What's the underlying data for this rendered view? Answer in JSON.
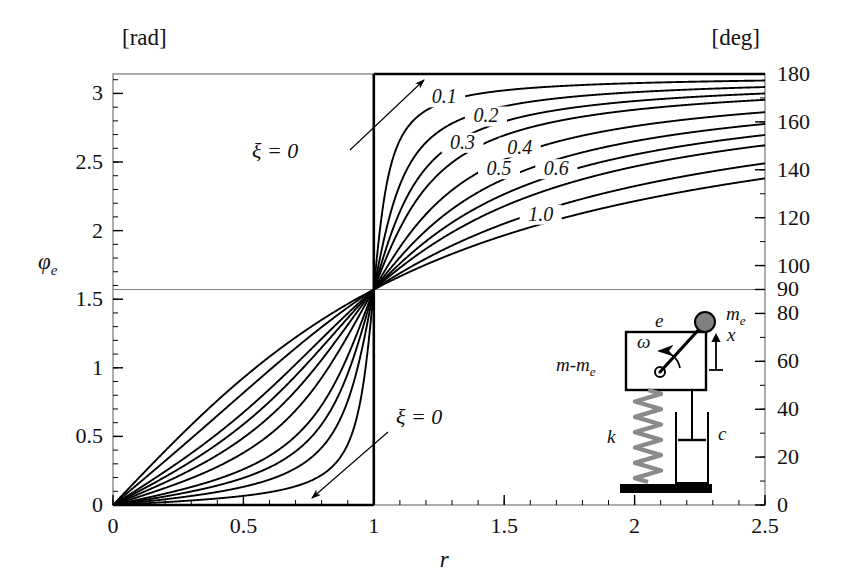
{
  "figure": {
    "left_unit": "[rad]",
    "right_unit": "[deg]",
    "x_axis_name": "r",
    "y_axis_name": "φ",
    "y_axis_name_sub": "e",
    "annotation_top": "ξ = 0",
    "annotation_bottom": "ξ = 0"
  },
  "chart_data": {
    "type": "line",
    "title": "",
    "xlabel": "r",
    "ylabel": "φ_e",
    "xlim": [
      0,
      2.5
    ],
    "ylim": [
      0,
      3.14159
    ],
    "ylim_deg": [
      0,
      180
    ],
    "grid": false,
    "legend": "inline-curve-labels",
    "x_ticks": [
      0,
      0.5,
      1,
      1.5,
      2,
      2.5
    ],
    "x_tick_labels": [
      "0",
      "0.5",
      "1",
      "1.5",
      "2",
      "2.5"
    ],
    "x_minor_step": 0.1,
    "y_ticks_rad": [
      0,
      0.5,
      1,
      1.5,
      2,
      2.5,
      3
    ],
    "y_tick_labels_rad": [
      "0",
      "0.5",
      "1",
      "1.5",
      "2",
      "2.5",
      "3"
    ],
    "y_minor_step_rad": 0.1,
    "y_ticks_deg": [
      0,
      20,
      40,
      60,
      80,
      90,
      100,
      120,
      140,
      160,
      180
    ],
    "y_tick_labels_deg": [
      "0",
      "20",
      "40",
      "60",
      "80",
      "90",
      "100",
      "120",
      "140",
      "160",
      "180"
    ],
    "y_minor_step_deg": 10,
    "reference_lines": [
      {
        "name": "r-equals-one",
        "orientation": "vertical",
        "value": 1
      },
      {
        "name": "phi-equals-90deg",
        "orientation": "horizontal",
        "value": 1.5708
      }
    ],
    "formula": "phi_e = atan2(2*zeta*r, 1 - r*r)",
    "series": [
      {
        "name": "0.05",
        "zeta": 0.05,
        "label": "",
        "labeled": false
      },
      {
        "name": "0.1",
        "zeta": 0.1,
        "label": "0.1",
        "labeled": true,
        "label_x": 1.27,
        "label_y_deg": 169
      },
      {
        "name": "0.15",
        "zeta": 0.15,
        "label": "",
        "labeled": false
      },
      {
        "name": "0.2",
        "zeta": 0.2,
        "label": "0.2",
        "labeled": true,
        "label_x": 1.43,
        "label_y_deg": 161
      },
      {
        "name": "0.3",
        "zeta": 0.3,
        "label": "0.3",
        "labeled": true,
        "label_x": 1.34,
        "label_y_deg": 150
      },
      {
        "name": "0.4",
        "zeta": 0.4,
        "label": "0.4",
        "labeled": true,
        "label_x": 1.56,
        "label_y_deg": 148
      },
      {
        "name": "0.5",
        "zeta": 0.5,
        "label": "0.5",
        "labeled": true,
        "label_x": 1.48,
        "label_y_deg": 139
      },
      {
        "name": "0.6",
        "zeta": 0.6,
        "label": "0.6",
        "labeled": true,
        "label_x": 1.7,
        "label_y_deg": 139
      },
      {
        "name": "0.8",
        "zeta": 0.8,
        "label": "",
        "labeled": false
      },
      {
        "name": "1.0",
        "zeta": 1.0,
        "label": "1.0",
        "labeled": true,
        "label_x": 1.64,
        "label_y_deg": 120
      }
    ]
  },
  "inset": {
    "name": "rotating-unbalance-mass-spring-damper",
    "mass_label": "m-m",
    "mass_label_sub": "e",
    "eccentric_mass_label": "m",
    "eccentric_mass_label_sub": "e",
    "eccentricity_label": "e",
    "omega_label": "ω",
    "displacement_label": "x",
    "spring_label": "k",
    "damper_label": "c"
  },
  "colors": {
    "curve": "#000000",
    "frame": "#000000",
    "reference_line": "#808080",
    "background": "#ffffff",
    "text": "#111111",
    "inset_spring": "#8a8a8a",
    "inset_mass_fill": "#808080"
  }
}
